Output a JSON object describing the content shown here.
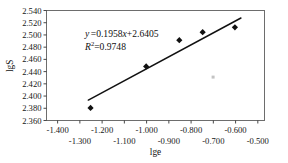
{
  "chart_data": {
    "type": "scatter",
    "title": "",
    "xlabel": "lge",
    "ylabel": "lgS",
    "xlim": [
      -1.45,
      -0.47
    ],
    "ylim": [
      2.36,
      2.54
    ],
    "grid": false,
    "legend": "none",
    "x_ticks_upper": [
      "-1.400",
      "-1.200",
      "-1.000",
      "-0.800",
      "-0.600"
    ],
    "x_ticks_lower": [
      "-1.300",
      "-1.100",
      "-0.900",
      "-0.700",
      "-0.500"
    ],
    "x_tick_values_upper": [
      -1.4,
      -1.2,
      -1.0,
      -0.8,
      -0.6
    ],
    "x_tick_values_lower": [
      -1.3,
      -1.1,
      -0.9,
      -0.7,
      -0.5
    ],
    "y_ticks": [
      "2.540",
      "2.520",
      "2.500",
      "2.480",
      "2.460",
      "2.440",
      "2.420",
      "2.400",
      "2.380",
      "2.360"
    ],
    "y_tick_values": [
      2.54,
      2.52,
      2.5,
      2.48,
      2.46,
      2.44,
      2.42,
      2.4,
      2.38,
      2.36
    ],
    "points": [
      {
        "x": -1.252,
        "y": 2.3805
      },
      {
        "x": -1.002,
        "y": 2.4485
      },
      {
        "x": -0.853,
        "y": 2.4915
      },
      {
        "x": -0.748,
        "y": 2.5045
      },
      {
        "x": -0.603,
        "y": 2.5125
      }
    ],
    "marker": "diamond",
    "marker_color": "#111111",
    "trendline": {
      "slope": 0.1958,
      "intercept": 2.6405,
      "x_start": -1.262,
      "x_end": -0.576,
      "color": "#111111"
    },
    "annotations": {
      "equation_y": "y",
      "equation_eq": "=0.1958",
      "equation_x": "x",
      "equation_tail": "+2.6405",
      "r2_symbol": "R",
      "r2_sup": "2",
      "r2_value": "=0.9748",
      "equation_full": "y =0.1958x+2.6405",
      "r2_full": "R2=0.9748"
    }
  },
  "axes": {
    "frame_color": "#6d6d6d",
    "tick_color": "#333333"
  }
}
